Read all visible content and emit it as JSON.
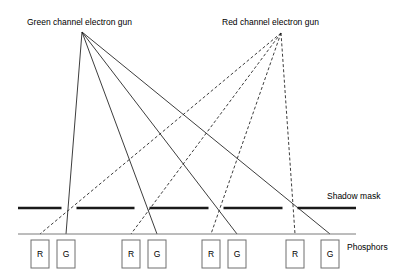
{
  "figure": {
    "title_green_gun": "Green channel electron gun",
    "title_red_gun": "Red channel electron gun",
    "label_shadow_mask": "Shadow mask",
    "label_phosphors": "Phosphors",
    "background_color": "#ffffff",
    "line_color": "#1a1a1a",
    "screen_line_color": "#7a7a7a",
    "phosphor_box_stroke": "#6e6e6e"
  },
  "guns": [
    {
      "id": "green-gun",
      "name": "Green channel electron gun",
      "apex_x": 82,
      "apex_y": 32,
      "beam_style": "solid",
      "targets": "G"
    },
    {
      "id": "red-gun",
      "name": "Red channel electron gun",
      "apex_x": 281,
      "apex_y": 33,
      "beam_style": "dashed",
      "targets": "R"
    }
  ],
  "shadow_mask": {
    "y": 208,
    "x_start": 18,
    "x_end": 356,
    "thickness": 2.6,
    "aperture_centers": [
      69,
      142,
      216,
      290
    ],
    "aperture_width": 15
  },
  "screen_line": {
    "y": 234,
    "x_start": 18,
    "x_end": 356
  },
  "phosphor_cells": [
    {
      "label": "R",
      "x": 31,
      "y": 240,
      "w": 18,
      "h": 28
    },
    {
      "label": "G",
      "x": 57,
      "y": 240,
      "w": 18,
      "h": 28
    },
    {
      "label": "R",
      "x": 122,
      "y": 240,
      "w": 18,
      "h": 28
    },
    {
      "label": "G",
      "x": 148,
      "y": 240,
      "w": 18,
      "h": 28
    },
    {
      "label": "R",
      "x": 202,
      "y": 240,
      "w": 18,
      "h": 28
    },
    {
      "label": "G",
      "x": 228,
      "y": 240,
      "w": 18,
      "h": 28
    },
    {
      "label": "R",
      "x": 286,
      "y": 240,
      "w": 18,
      "h": 28
    },
    {
      "label": "G",
      "x": 321,
      "y": 240,
      "w": 18,
      "h": 28
    }
  ],
  "green_beams": [
    {
      "aperture_x": 69,
      "target_x": 66
    },
    {
      "aperture_x": 142,
      "target_x": 157
    },
    {
      "aperture_x": 216,
      "target_x": 237
    },
    {
      "aperture_x": 290,
      "target_x": 330
    }
  ],
  "red_beams": [
    {
      "aperture_x": 69,
      "target_x": 40
    },
    {
      "aperture_x": 142,
      "target_x": 131
    },
    {
      "aperture_x": 216,
      "target_x": 211
    },
    {
      "aperture_x": 290,
      "target_x": 295
    }
  ]
}
